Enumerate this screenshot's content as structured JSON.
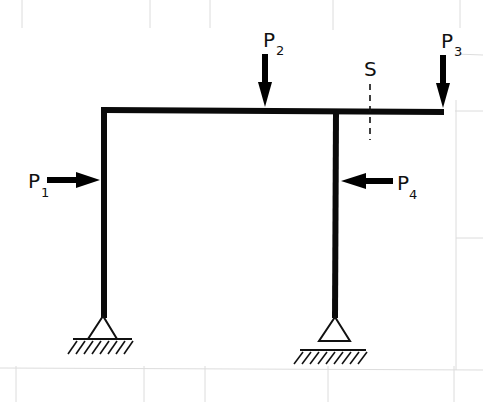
{
  "diagram": {
    "loads": [
      {
        "id": "P1",
        "label": "P",
        "subscript": "1",
        "direction": "right",
        "applied_to": "left column"
      },
      {
        "id": "P2",
        "label": "P",
        "subscript": "2",
        "direction": "down",
        "applied_to": "beam"
      },
      {
        "id": "P3",
        "label": "P",
        "subscript": "3",
        "direction": "down",
        "applied_to": "beam right end"
      },
      {
        "id": "P4",
        "label": "P",
        "subscript": "4",
        "direction": "left",
        "applied_to": "right column"
      }
    ],
    "section": {
      "label": "S",
      "style": "dashed"
    },
    "supports": [
      {
        "id": "left-support",
        "type": "pinned"
      },
      {
        "id": "right-support",
        "type": "roller"
      }
    ],
    "colors": {
      "member": "#0a0a0a",
      "grid": "#dcdcdc",
      "background": "#ffffff"
    }
  }
}
